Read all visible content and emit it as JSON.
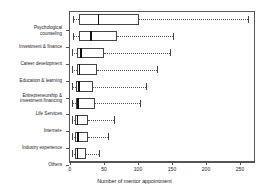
{
  "chart_data": {
    "type": "boxplot",
    "title": "",
    "xlabel": "Number of mentor appointment",
    "ylabel": "",
    "orientation": "horizontal",
    "xlim": [
      -6,
      268
    ],
    "xticks": [
      0,
      50,
      100,
      150,
      200,
      250
    ],
    "xticklabels": [
      "0",
      "50",
      "100",
      "150",
      "200",
      "250"
    ],
    "grid": false,
    "legend": null,
    "categories": [
      "Psychological\ncounseling",
      "Investment & finance",
      "Career development",
      "Education & learning",
      "Entrepreneurship &\ninvestment financing",
      "Life Services",
      "Internet+",
      "Industry experience",
      "Others"
    ],
    "boxes": [
      {
        "label": "Psychological counseling",
        "whisker_low": 4,
        "q1": 13,
        "median": 42,
        "q3": 102,
        "whisker_high": 262
      },
      {
        "label": "Investment & finance",
        "whisker_low": 4,
        "q1": 13,
        "median": 31,
        "q3": 69,
        "whisker_high": 152
      },
      {
        "label": "Career development",
        "whisker_low": 3,
        "q1": 10,
        "median": 16,
        "q3": 50,
        "whisker_high": 147
      },
      {
        "label": "Education & learning",
        "whisker_low": 3,
        "q1": 10,
        "median": 14,
        "q3": 40,
        "whisker_high": 128
      },
      {
        "label": "Entrepreneurship & investment financing",
        "whisker_low": 3,
        "q1": 9,
        "median": 13,
        "q3": 34,
        "whisker_high": 112
      },
      {
        "label": "Life Services",
        "whisker_low": 3,
        "q1": 9,
        "median": 12,
        "q3": 37,
        "whisker_high": 103
      },
      {
        "label": "Internet+",
        "whisker_low": 3,
        "q1": 8,
        "median": 11,
        "q3": 27,
        "whisker_high": 64
      },
      {
        "label": "Industry experience",
        "whisker_low": 3,
        "q1": 8,
        "median": 12,
        "q3": 26,
        "whisker_high": 56
      },
      {
        "label": "Others",
        "whisker_low": 3,
        "q1": 8,
        "median": 11,
        "q3": 24,
        "whisker_high": 42
      }
    ]
  },
  "colors": {
    "frame": "#555555",
    "box_edge": "#444444",
    "median": "#111111",
    "whisker": "#555555",
    "text": "#1a1a1a",
    "background": "#ffffff"
  }
}
